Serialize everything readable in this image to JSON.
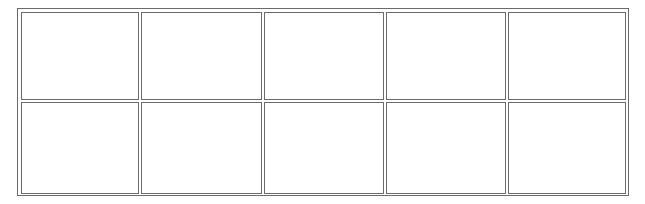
{
  "grid": {
    "rows": 2,
    "columns": 5,
    "border_color": "#6b6b6b",
    "background_color": "#ffffff",
    "column_edges": [
      [
        21,
        139
      ],
      [
        141,
        262
      ],
      [
        264,
        384
      ],
      [
        386,
        506
      ],
      [
        508,
        626
      ]
    ],
    "row_edges": [
      [
        12,
        100
      ],
      [
        102,
        194
      ]
    ],
    "cells": [
      {
        "row": 0,
        "col": 0,
        "text": ""
      },
      {
        "row": 0,
        "col": 1,
        "text": ""
      },
      {
        "row": 0,
        "col": 2,
        "text": ""
      },
      {
        "row": 0,
        "col": 3,
        "text": ""
      },
      {
        "row": 0,
        "col": 4,
        "text": ""
      },
      {
        "row": 1,
        "col": 0,
        "text": ""
      },
      {
        "row": 1,
        "col": 1,
        "text": ""
      },
      {
        "row": 1,
        "col": 2,
        "text": ""
      },
      {
        "row": 1,
        "col": 3,
        "text": ""
      },
      {
        "row": 1,
        "col": 4,
        "text": ""
      }
    ]
  }
}
